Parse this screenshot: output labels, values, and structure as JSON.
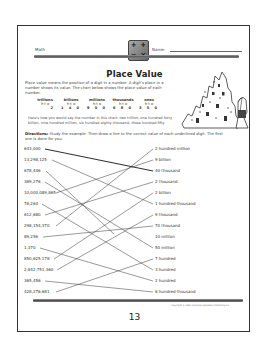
{
  "header": {
    "subject": "Math",
    "name_label": "Name:",
    "badge_symbols": [
      "+",
      "+",
      "−",
      "×"
    ]
  },
  "title": "Place Value",
  "intro": "Place value means the position of a digit in a number. A digit's place in a number shows its value. The chart below shows the place value of each number.",
  "place_value_chart": {
    "columns": [
      {
        "label": "trillions",
        "sub": "h t o",
        "digits": "2"
      },
      {
        "label": "billions",
        "sub": "h t o",
        "digits": "1 4 0"
      },
      {
        "label": "millions",
        "sub": "h t o",
        "digits": "9 0 0"
      },
      {
        "label": "thousands",
        "sub": "h t o",
        "digits": "6 8 0"
      },
      {
        "label": "ones",
        "sub": "h t o",
        "digits": "3 5 0"
      }
    ]
  },
  "example_text": "Here's how you would say the number in this chart: two trillion, one hundred forty billion, nine hundred million, six hundred eighty thousand, three hundred fifty.",
  "directions": {
    "label": "Directions:",
    "text": "Study the example. Then draw a line to the correct value of each underlined digit. The first one is done for you."
  },
  "left_numbers": [
    "643,000",
    "13,298,125",
    "678,446",
    "389,276",
    "10,000,089,865",
    "78,264",
    "612,680",
    "298,154,370",
    "89,256",
    "1,370",
    "850,625,178",
    "2,842,751,360",
    "365,456",
    "428,276,681"
  ],
  "right_values": [
    "2 hundred million",
    "9 billion",
    "40 thousand",
    "2 thousand",
    "2 billion",
    "1 hundred thousand",
    "9 thousand",
    "70 thousand",
    "10 million",
    "50 million",
    "7 hundred",
    "3 hundred",
    "2 hundred",
    "6 hundred thousand"
  ],
  "footer": {
    "copyright": "Copyright © 1991 American Education Publishing Co.",
    "page_number": "13"
  }
}
